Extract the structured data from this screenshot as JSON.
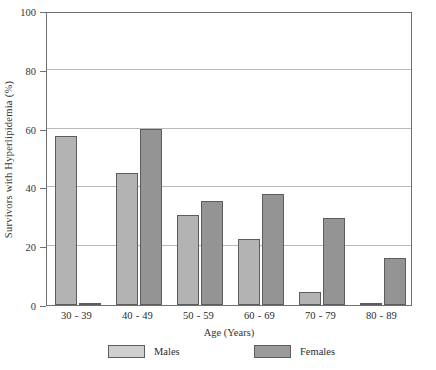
{
  "figure": {
    "top_artifact_text": "· ·· ···· ·· ··· ···· ··",
    "background": "#ffffff"
  },
  "chart_data": {
    "type": "bar",
    "title": "",
    "subtitle": "",
    "xlabel": "Age (Years)",
    "ylabel": "Survivors with Hyperlipidemia (%)",
    "categories": [
      "30 - 39",
      "40 - 49",
      "50 - 59",
      "60 - 69",
      "70 - 79",
      "80 - 89"
    ],
    "series": [
      {
        "name": "Males",
        "color": "#b3b3b3",
        "values": [
          57.5,
          45.0,
          30.5,
          22.5,
          4.3,
          0.7
        ]
      },
      {
        "name": "Females",
        "color": "#949494",
        "values": [
          0.5,
          59.8,
          35.3,
          37.8,
          29.5,
          16.0
        ]
      }
    ],
    "ylim": [
      0,
      100
    ],
    "yticks": [
      0,
      20,
      40,
      60,
      80,
      100
    ],
    "ytick_labels": [
      "0",
      "20",
      "40",
      "60",
      "80",
      "100"
    ],
    "grid": "horizontal",
    "legend_position": "below-axis",
    "bar_edge_color": "#5d5d5d",
    "axis_color": "#6f6f6f",
    "gridline_color": "#b9b9b9"
  },
  "legend": {
    "entries": [
      {
        "label": "Males",
        "swatch": "#cfcfcf"
      },
      {
        "label": "Females",
        "swatch": "#9a9a9a"
      }
    ]
  }
}
